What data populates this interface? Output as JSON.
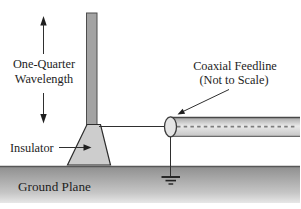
{
  "diagram": {
    "type": "antenna-schematic",
    "labels": {
      "wavelength_line1": "One-Quarter",
      "wavelength_line2": "Wavelength",
      "insulator": "Insulator",
      "coax_line1": "Coaxial Feedline",
      "coax_line2": "(Not to Scale)",
      "ground_plane": "Ground Plane"
    },
    "colors": {
      "background": "#ffffff",
      "ink": "#1f1f1f",
      "text": "#1d1d1d",
      "antenna_fill": "#a3a3a3",
      "antenna_stroke": "#4d4d4d",
      "insulator_fill": "#cdcdcd",
      "insulator_stroke": "#2d2d2d",
      "coax_edge": "#a6a6a6",
      "coax_mid": "#eaeaea",
      "coax_low": "#c4c4c4",
      "coax_cap_fill": "#e5e5e5",
      "ground_top": "#8f8f8f",
      "ground_mid": "#c6c6c6",
      "ground_bottom": "#e7e7e7"
    }
  }
}
